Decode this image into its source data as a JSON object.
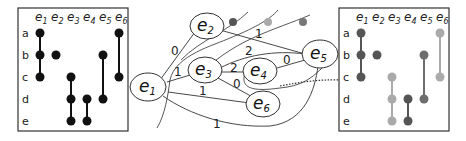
{
  "left_matrix": {
    "rows": [
      "a",
      "b",
      "c",
      "d",
      "e"
    ],
    "columns": [
      {
        "base": "e",
        "sub": "1"
      },
      {
        "base": "e",
        "sub": "2"
      },
      {
        "base": "e",
        "sub": "3"
      },
      {
        "base": "e",
        "sub": "4"
      },
      {
        "base": "e",
        "sub": "5"
      },
      {
        "base": "e",
        "sub": "6"
      }
    ],
    "memberships": {
      "e1": [
        "a",
        "b",
        "c"
      ],
      "e2": [
        "b"
      ],
      "e3": [
        "c",
        "d",
        "e"
      ],
      "e4": [
        "d",
        "e"
      ],
      "e5": [
        "b",
        "d"
      ],
      "e6": [
        "a",
        "c"
      ]
    },
    "dot_color": "#111111"
  },
  "graph": {
    "nodes": [
      {
        "id": "e1",
        "base": "e",
        "sub": "1"
      },
      {
        "id": "e2",
        "base": "e",
        "sub": "2"
      },
      {
        "id": "e3",
        "base": "e",
        "sub": "3"
      },
      {
        "id": "e4",
        "base": "e",
        "sub": "4"
      },
      {
        "id": "e5",
        "base": "e",
        "sub": "5"
      },
      {
        "id": "e6",
        "base": "e",
        "sub": "6"
      }
    ],
    "edges": [
      {
        "from": "e1",
        "to": "e2",
        "weight": "0"
      },
      {
        "from": "e1",
        "to": "e3",
        "weight": "1"
      },
      {
        "from": "e1",
        "to": "e6",
        "weight": "1"
      },
      {
        "from": "e1",
        "to": "e5",
        "weight": "1"
      },
      {
        "from": "e2",
        "to": "e5",
        "weight": "1"
      },
      {
        "from": "e3",
        "to": "e5",
        "weight": "2"
      },
      {
        "from": "e3",
        "to": "e4",
        "weight": "2"
      },
      {
        "from": "e3",
        "to": "e6",
        "weight": "0"
      },
      {
        "from": "e4",
        "to": "e5",
        "weight": "0"
      }
    ],
    "cluster_dots": [
      {
        "color": "#555555"
      },
      {
        "color": "#aaaaaa"
      },
      {
        "color": "#777777"
      }
    ]
  },
  "right_matrix": {
    "rows": [
      "a",
      "b",
      "c",
      "d",
      "e"
    ],
    "columns": [
      {
        "base": "e",
        "sub": "1"
      },
      {
        "base": "e",
        "sub": "2"
      },
      {
        "base": "e",
        "sub": "3"
      },
      {
        "base": "e",
        "sub": "4"
      },
      {
        "base": "e",
        "sub": "5"
      },
      {
        "base": "e",
        "sub": "6"
      }
    ],
    "column_colors": [
      "#555555",
      "#555555",
      "#aaaaaa",
      "#555555",
      "#6e6e6e",
      "#aaaaaa"
    ]
  }
}
